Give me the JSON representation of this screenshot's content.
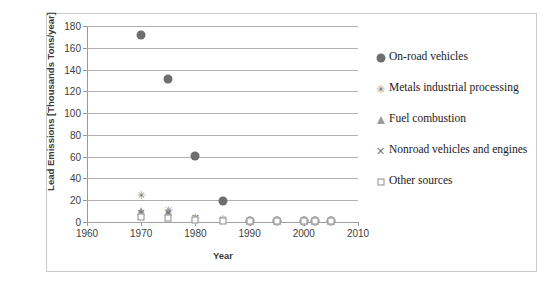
{
  "chart_data": {
    "type": "scatter",
    "title": "",
    "xlabel": "Year",
    "ylabel": "Lead Emissions [Thousands Tons/year]",
    "xlim": [
      1960,
      2010
    ],
    "ylim": [
      0,
      180
    ],
    "xticks": [
      1960,
      1970,
      1980,
      1990,
      2000,
      2010
    ],
    "yticks": [
      0,
      20,
      40,
      60,
      80,
      100,
      120,
      140,
      160,
      180
    ],
    "grid": "horizontal",
    "legend_position": "right",
    "series": [
      {
        "name": "On-road vehicles",
        "marker": "filled-circle",
        "color": "#6e6e6e",
        "points": [
          {
            "x": 1970,
            "y": 172
          },
          {
            "x": 1975,
            "y": 131
          },
          {
            "x": 1980,
            "y": 61
          },
          {
            "x": 1985,
            "y": 19
          },
          {
            "x": 1990,
            "y": 1
          },
          {
            "x": 1995,
            "y": 1
          },
          {
            "x": 2000,
            "y": 1
          },
          {
            "x": 2002,
            "y": 1
          },
          {
            "x": 2005,
            "y": 1
          }
        ]
      },
      {
        "name": "Metals industrial processing",
        "marker": "star",
        "color": "#7a7a7a",
        "points": [
          {
            "x": 1970,
            "y": 25
          },
          {
            "x": 1975,
            "y": 11
          },
          {
            "x": 1980,
            "y": 4
          },
          {
            "x": 1985,
            "y": 3
          },
          {
            "x": 1990,
            "y": 2
          },
          {
            "x": 1995,
            "y": 2
          },
          {
            "x": 2000,
            "y": 2
          },
          {
            "x": 2002,
            "y": 2
          },
          {
            "x": 2005,
            "y": 2
          }
        ]
      },
      {
        "name": "Fuel combustion",
        "marker": "triangle",
        "color": "#9a9a9a",
        "points": [
          {
            "x": 1970,
            "y": 10
          },
          {
            "x": 1975,
            "y": 9
          },
          {
            "x": 1980,
            "y": 4
          },
          {
            "x": 1985,
            "y": 2
          },
          {
            "x": 1990,
            "y": 1
          },
          {
            "x": 1995,
            "y": 1
          },
          {
            "x": 2000,
            "y": 1
          },
          {
            "x": 2002,
            "y": 1
          },
          {
            "x": 2005,
            "y": 1
          }
        ]
      },
      {
        "name": "Nonroad vehicles and engines",
        "marker": "x",
        "color": "#7a7a7a",
        "points": [
          {
            "x": 1970,
            "y": 8
          },
          {
            "x": 1975,
            "y": 8
          },
          {
            "x": 1980,
            "y": 4
          },
          {
            "x": 1985,
            "y": 2
          },
          {
            "x": 1990,
            "y": 1
          },
          {
            "x": 1995,
            "y": 1
          },
          {
            "x": 2000,
            "y": 1
          },
          {
            "x": 2002,
            "y": 1
          },
          {
            "x": 2005,
            "y": 1
          }
        ]
      },
      {
        "name": "Other sources",
        "marker": "open-square",
        "color": "#8c8c8c",
        "points": [
          {
            "x": 1970,
            "y": 5
          },
          {
            "x": 1975,
            "y": 4
          },
          {
            "x": 1980,
            "y": 2
          },
          {
            "x": 1985,
            "y": 1
          },
          {
            "x": 1990,
            "y": 1
          },
          {
            "x": 1995,
            "y": 1
          },
          {
            "x": 2000,
            "y": 1
          },
          {
            "x": 2002,
            "y": 1
          },
          {
            "x": 2005,
            "y": 1
          }
        ]
      }
    ]
  },
  "axes": {
    "ylabel": "Lead Emissions [Thousands Tons/year]",
    "xlabel": "Year"
  },
  "legend": {
    "items": [
      {
        "label": "On-road vehicles",
        "marker": "filled-circle"
      },
      {
        "label": "Metals industrial processing",
        "marker": "star"
      },
      {
        "label": "Fuel combustion",
        "marker": "triangle"
      },
      {
        "label": "Nonroad vehicles and engines",
        "marker": "x"
      },
      {
        "label": "Other sources",
        "marker": "open-square"
      }
    ]
  }
}
